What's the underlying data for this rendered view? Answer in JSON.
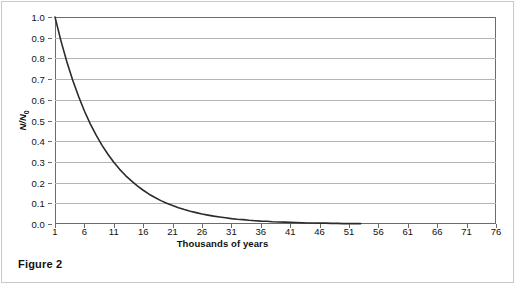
{
  "figure": {
    "caption": "Figure 2"
  },
  "chart_data": {
    "type": "line",
    "title": "",
    "xlabel": "Thousands of years",
    "ylabel": "N/N0",
    "ylabel_base": "N/N",
    "ylabel_sub": "0",
    "xlim": [
      1,
      76
    ],
    "ylim": [
      0.0,
      1.0
    ],
    "grid": true,
    "legend": "none",
    "xticks": [
      1,
      6,
      11,
      16,
      21,
      26,
      31,
      36,
      41,
      46,
      51,
      56,
      61,
      66,
      71,
      76
    ],
    "xticklabels": [
      "1",
      "6",
      "11",
      "16",
      "21",
      "26",
      "31",
      "36",
      "41",
      "46",
      "51",
      "56",
      "61",
      "66",
      "71",
      "76"
    ],
    "yticks": [
      0.0,
      0.1,
      0.2,
      0.3,
      0.4,
      0.5,
      0.6,
      0.7,
      0.8,
      0.9,
      1.0
    ],
    "yticklabels": [
      "0.0",
      "0.1",
      "0.2",
      "0.3",
      "0.4",
      "0.5",
      "0.6",
      "0.7",
      "0.8",
      "0.9",
      "1.0"
    ],
    "series": [
      {
        "name": "Radioactive decay",
        "color": "#2b2b2b",
        "half_life": 5.7,
        "x": [
          1,
          2,
          3,
          4,
          5,
          6,
          7,
          8,
          9,
          10,
          11,
          12,
          13,
          14,
          15,
          16,
          17,
          18,
          19,
          20,
          21,
          22,
          23,
          24,
          25,
          26,
          27,
          28,
          29,
          30,
          31,
          32,
          33,
          34,
          35,
          36,
          37,
          38,
          39,
          40,
          41,
          42,
          43,
          44,
          45,
          46,
          47,
          48,
          49,
          50,
          51,
          52,
          53
        ],
        "y": [
          1.0,
          0.886,
          0.785,
          0.696,
          0.617,
          0.546,
          0.484,
          0.429,
          0.38,
          0.337,
          0.298,
          0.264,
          0.234,
          0.208,
          0.184,
          0.163,
          0.144,
          0.128,
          0.113,
          0.1,
          0.089,
          0.079,
          0.07,
          0.062,
          0.055,
          0.048,
          0.043,
          0.038,
          0.034,
          0.03,
          0.026,
          0.023,
          0.021,
          0.018,
          0.016,
          0.014,
          0.013,
          0.011,
          0.01,
          0.009,
          0.008,
          0.007,
          0.006,
          0.005,
          0.005,
          0.004,
          0.004,
          0.003,
          0.003,
          0.002,
          0.002,
          0.002,
          0.002
        ]
      }
    ]
  },
  "colors": {
    "curve": "#2b2b2b",
    "gridline": "#b4b4b4",
    "axis": "#6b6b6b",
    "text": "#111111"
  }
}
